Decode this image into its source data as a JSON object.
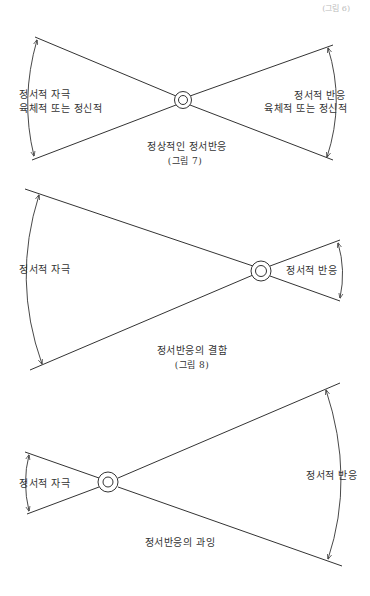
{
  "page": {
    "page_mark": "(그림 6)"
  },
  "figures": [
    {
      "id": "figure-7",
      "left_label_line1": "정서적 자극",
      "left_label_line2": "육체적 또는 정신적",
      "right_label_line1": "정서적 반응",
      "right_label_line2": "육체적 또는 정신적",
      "caption": "정상적인  정서반응",
      "figure_number": "(그림 7)"
    },
    {
      "id": "figure-8",
      "left_label": "정서적 자극",
      "right_label": "정서적 반응",
      "caption": "정서반응의 결함",
      "figure_number": "(그림 8)"
    },
    {
      "id": "figure-9",
      "left_label": "정서적 자극",
      "right_label": "정서적 반응",
      "caption": "정서반응의 과잉"
    }
  ],
  "colors": {
    "line": "#333333",
    "background": "#ffffff"
  }
}
